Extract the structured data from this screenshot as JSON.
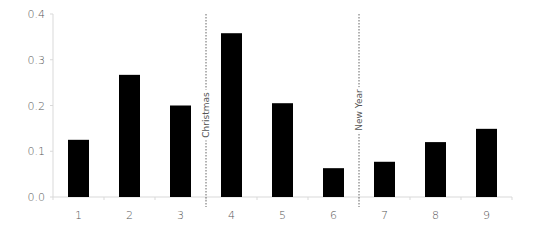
{
  "chart_data": {
    "type": "bar",
    "title": "",
    "xlabel": "",
    "ylabel": "",
    "categories": [
      "1",
      "2",
      "3",
      "4",
      "5",
      "6",
      "7",
      "8",
      "9"
    ],
    "values": [
      0.125,
      0.267,
      0.2,
      0.358,
      0.205,
      0.063,
      0.077,
      0.12,
      0.149
    ],
    "ylim": [
      0.0,
      0.4
    ],
    "yticks": [
      "0.0",
      "0.1",
      "0.2",
      "0.3",
      "0.4"
    ],
    "grid": false,
    "legend": null,
    "bar_color": "#000000",
    "axis_color": "#d9d9d9",
    "annotations": [
      {
        "type": "vertical-dotted-line",
        "label": "Christmas",
        "between": [
          "3",
          "4"
        ]
      },
      {
        "type": "vertical-dotted-line",
        "label": "New Year",
        "between": [
          "6",
          "7"
        ]
      }
    ]
  }
}
